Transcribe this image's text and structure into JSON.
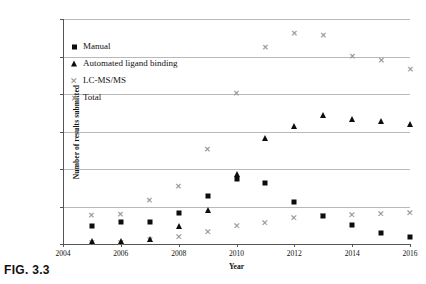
{
  "figure": {
    "caption": "FIG. 3.3"
  },
  "chart_data": {
    "type": "scatter",
    "title": "",
    "xlabel": "Year",
    "ylabel": "Number of results submitted",
    "xlim": [
      2004,
      2016
    ],
    "ylim": [
      0,
      1200
    ],
    "xticks": [
      2004,
      2006,
      2008,
      2010,
      2012,
      2014,
      2016
    ],
    "xticklabels": [
      "2004",
      "2006",
      "2008",
      "2010",
      "2012",
      "2014",
      "2016"
    ],
    "yticks": [
      0,
      200,
      400,
      600,
      800,
      1000,
      1200
    ],
    "yticklabels": [
      "0",
      "200",
      "400",
      "600",
      "800",
      "1000",
      "1200"
    ],
    "grid": "horizontal",
    "legend_position": "upper-left-inside",
    "x": [
      2005,
      2006,
      2007,
      2008,
      2009,
      2010,
      2011,
      2012,
      2013,
      2014,
      2015,
      2016
    ],
    "series": [
      {
        "name": "Manual",
        "marker": "square",
        "color": "#0d0d0d",
        "values": [
          95,
          120,
          115,
          165,
          255,
          345,
          325,
          225,
          150,
          100,
          60,
          40
        ]
      },
      {
        "name": "Automated ligand binding",
        "marker": "triangle",
        "color": "#0d0d0d",
        "values": [
          15,
          15,
          25,
          95,
          180,
          375,
          565,
          630,
          690,
          665,
          655,
          640
        ]
      },
      {
        "name": "LC-MS/MS",
        "marker": "x",
        "color": "#8b8b8b",
        "values": [
          5,
          5,
          20,
          40,
          65,
          95,
          110,
          140,
          150,
          155,
          160,
          165
        ]
      },
      {
        "name": "Total",
        "marker": "star",
        "color": "#9a9a9a",
        "values": [
          150,
          155,
          230,
          305,
          500,
          800,
          1045,
          1120,
          1110,
          1000,
          975,
          930
        ]
      }
    ]
  }
}
